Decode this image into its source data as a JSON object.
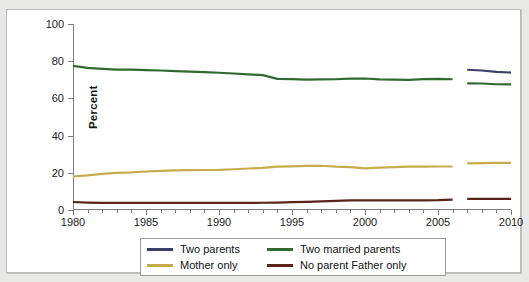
{
  "chart_data": {
    "type": "line",
    "title": "",
    "xlabel": "",
    "ylabel": "Percent",
    "xlim": [
      1980,
      2010
    ],
    "ylim": [
      0,
      100
    ],
    "grid": false,
    "legend_position": "bottom",
    "y_ticks": [
      0,
      20,
      40,
      60,
      80,
      100
    ],
    "x_tick_labels": [
      "1980",
      "1985",
      "1990",
      "1995",
      "2000",
      "2005",
      "2010"
    ],
    "x_minor_tick_interval": 1,
    "break_note": "Series break between 2006 and 2007; a separate 'Two parents' series begins in 2007.",
    "series": [
      {
        "name": "Two parents",
        "color": "#3a3f6b",
        "x": [
          2007,
          2008,
          2009,
          2010
        ],
        "values": [
          75.4,
          75.0,
          74.3,
          73.9
        ]
      },
      {
        "name": "Two married parents",
        "color": "#2f6b2f",
        "x": [
          1980,
          1981,
          1982,
          1983,
          1984,
          1985,
          1986,
          1987,
          1988,
          1989,
          1990,
          1991,
          1992,
          1993,
          1994,
          1995,
          1996,
          1997,
          1998,
          1999,
          2000,
          2001,
          2002,
          2003,
          2004,
          2005,
          2006
        ],
        "values": [
          77.5,
          76.4,
          75.9,
          75.5,
          75.5,
          75.2,
          75.0,
          74.7,
          74.4,
          74.1,
          73.8,
          73.4,
          72.9,
          72.5,
          70.5,
          70.4,
          70.1,
          70.2,
          70.3,
          70.6,
          70.7,
          70.2,
          70.1,
          70.0,
          70.4,
          70.5,
          70.3
        ]
      },
      {
        "name": "Two married parents (2007+)",
        "color": "#2f6b2f",
        "x": [
          2007,
          2008,
          2009,
          2010
        ],
        "values": [
          68.1,
          68.0,
          67.6,
          67.5
        ]
      },
      {
        "name": "Mother only",
        "color": "#c8ac4a",
        "x": [
          1980,
          1981,
          1982,
          1983,
          1984,
          1985,
          1986,
          1987,
          1988,
          1989,
          1990,
          1991,
          1992,
          1993,
          1994,
          1995,
          1996,
          1997,
          1998,
          1999,
          2000,
          2001,
          2002,
          2003,
          2004,
          2005,
          2006
        ],
        "values": [
          18.0,
          18.6,
          19.4,
          20.0,
          20.2,
          20.7,
          21.0,
          21.3,
          21.4,
          21.5,
          21.6,
          21.9,
          22.3,
          22.6,
          23.3,
          23.5,
          23.7,
          23.8,
          23.3,
          23.0,
          22.4,
          22.8,
          23.1,
          23.3,
          23.3,
          23.4,
          23.4
        ]
      },
      {
        "name": "Mother only (2007+)",
        "color": "#c8ac4a",
        "x": [
          2007,
          2008,
          2009,
          2010
        ],
        "values": [
          25.1,
          25.2,
          25.3,
          25.3
        ]
      },
      {
        "name": "No parent Father only",
        "color": "#5a2418",
        "x": [
          1980,
          1981,
          1982,
          1983,
          1984,
          1985,
          1986,
          1987,
          1988,
          1989,
          1990,
          1991,
          1992,
          1993,
          1994,
          1995,
          1996,
          1997,
          1998,
          1999,
          2000,
          2001,
          2002,
          2003,
          2004,
          2005,
          2006
        ],
        "values": [
          4.3,
          4.0,
          3.8,
          3.8,
          3.8,
          3.8,
          3.8,
          3.8,
          3.8,
          3.8,
          3.8,
          3.8,
          3.8,
          3.9,
          4.0,
          4.2,
          4.4,
          4.6,
          4.9,
          5.2,
          5.2,
          5.2,
          5.2,
          5.2,
          5.2,
          5.3,
          5.6
        ]
      },
      {
        "name": "No parent Father only (2007+)",
        "color": "#5a2418",
        "x": [
          2007,
          2008,
          2009,
          2010
        ],
        "values": [
          6.0,
          6.0,
          6.0,
          6.0
        ]
      }
    ]
  },
  "legend": {
    "entries": [
      {
        "label": "Two parents",
        "color": "#3a3f6b"
      },
      {
        "label": "Two married parents",
        "color": "#2f6b2f"
      },
      {
        "label": "Mother only",
        "color": "#c8ac4a"
      },
      {
        "label": "No parent Father only",
        "color": "#5a2418"
      }
    ]
  }
}
